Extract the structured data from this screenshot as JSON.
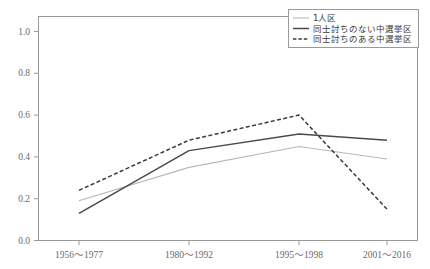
{
  "chart_data": {
    "type": "line",
    "title": "",
    "xlabel": "",
    "ylabel": "",
    "categories": [
      "1956～1977",
      "1980～1992",
      "1995～1998",
      "2001～2016"
    ],
    "ylim": [
      0.0,
      1.0
    ],
    "ytick_labels": [
      "0.0",
      "0.2",
      "0.4",
      "0.6",
      "0.8",
      "1.0"
    ],
    "ytick_values": [
      0.0,
      0.2,
      0.4,
      0.6,
      0.8,
      1.0
    ],
    "grid": false,
    "legend_position": "top-right",
    "series": [
      {
        "name": "1人区",
        "values": [
          0.19,
          0.35,
          0.45,
          0.39
        ],
        "color": "#b8b8b8",
        "style": "solid",
        "width": 1.1
      },
      {
        "name": "同士討ちのない中選挙区",
        "values": [
          0.13,
          0.43,
          0.51,
          0.48
        ],
        "color": "#4a4a4a",
        "style": "solid",
        "width": 1.5
      },
      {
        "name": "同士討ちのある中選挙区",
        "values": [
          0.24,
          0.48,
          0.6,
          0.15
        ],
        "color": "#3a3a3a",
        "style": "dashed",
        "width": 1.5
      }
    ]
  },
  "legend": {
    "entries": [
      {
        "label": "1人区"
      },
      {
        "label": "同士討ちのない中選挙区"
      },
      {
        "label": "同士討ちのある中選挙区"
      }
    ]
  },
  "axes": {
    "y_labels": [
      "1.0",
      "0.8",
      "0.6",
      "0.4",
      "0.2",
      "0.0"
    ],
    "x_labels": [
      "1956～1977",
      "1980～1992",
      "1995～1998",
      "2001～2016"
    ]
  },
  "colors": {
    "frame": "#9a9a9a",
    "tick_text": "#6a6a6a",
    "series_light": "#b8b8b8",
    "series_solid": "#4a4a4a",
    "series_dashed": "#3a3a3a",
    "background": "#ffffff"
  }
}
